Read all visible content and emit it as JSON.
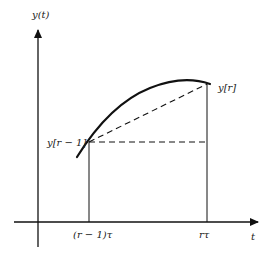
{
  "diagram": {
    "y_axis_label": "y(t)",
    "t_axis_label": "t",
    "point_prev_label": "y[r − 1]",
    "point_curr_label": "y[r]",
    "tick_prev_label": "(r − 1)τ",
    "tick_curr_label": "rτ",
    "colors": {
      "stroke": "#111111",
      "background": "#ffffff"
    }
  }
}
